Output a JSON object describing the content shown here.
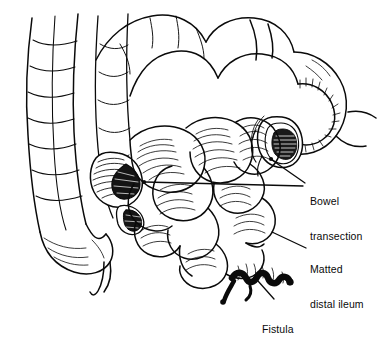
{
  "figure": {
    "kind": "medical-line-illustration",
    "background_color": "#ffffff",
    "ink_color": "#0a0a0a"
  },
  "labels": [
    {
      "id": "bowel-transection",
      "line1": "Bowel",
      "line2": "transection",
      "leader": "two lines converging to the right and left transected bowel stumps"
    },
    {
      "id": "matted-distal-ileum",
      "line1": "Matted",
      "line2": "distal ileum",
      "leader": "single line to the conglomerate bowel mass"
    },
    {
      "id": "fistula",
      "line1": "Fistula",
      "leader": "single line to the dark serpentine fistulous tract"
    }
  ],
  "anatomy": {
    "ascending_colon": "vertical haustrated tube along left margin",
    "transverse_colon": "looping bowel across the top",
    "right_transection_stump": "open lumen with concentric rings, upper right",
    "left_transection_stump": "open lumen with concentric rings, mid left",
    "matted_mass": "cluster of rounded adherent small-bowel loops, center",
    "fistula_tract": "solid black irregular tract at lower center",
    "cecum": "rounded pouch tapering at lower left"
  }
}
